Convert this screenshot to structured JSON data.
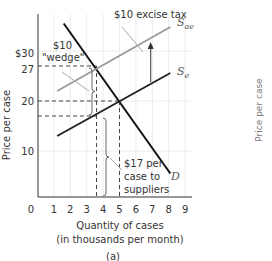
{
  "chart_data": {
    "type": "line",
    "panel_label": "(a)",
    "xlabel_line1": "Quantity of cases",
    "xlabel_line2": "(in thousands per month)",
    "ylabel": "Price per case",
    "right_panel_ylabel": "Price per case",
    "xlim": [
      0,
      9
    ],
    "ylim": [
      0,
      30
    ],
    "x_ticks": [
      "0",
      "1",
      "2",
      "3",
      "4",
      "5",
      "6",
      "7",
      "8",
      "9"
    ],
    "y_ticks": [
      {
        "value": 30,
        "label": "$30"
      },
      {
        "value": 27,
        "label": "27"
      },
      {
        "value": 20,
        "label": "20"
      },
      {
        "value": 10,
        "label": "10"
      }
    ],
    "grid": true,
    "series": [
      {
        "name": "D",
        "label": "D",
        "color": "#111111",
        "points": [
          [
            1.6,
            35.5
          ],
          [
            8.1,
            5.5
          ]
        ]
      },
      {
        "name": "Se",
        "label": "S",
        "subscript": "e",
        "color": "#222222",
        "points": [
          [
            1.2,
            13
          ],
          [
            8.1,
            25.6
          ]
        ]
      },
      {
        "name": "Sae",
        "label": "S",
        "subscript": "ae",
        "color": "#999999",
        "points": [
          [
            1.2,
            22
          ],
          [
            8.1,
            34.8
          ]
        ]
      }
    ],
    "equilibrium": {
      "q": 5,
      "p": 20
    },
    "tax_equilibrium": {
      "q": 3.6,
      "p_buyers": 27,
      "p_suppliers": 17
    },
    "annotations": {
      "excise_tax": "$10 excise tax",
      "wedge_line1": "$10",
      "wedge_line2": "\"wedge\"",
      "suppliers_line1": "$17 per",
      "suppliers_line2": "case to",
      "suppliers_line3": "suppliers"
    },
    "tax_arrow": {
      "q": 6.9,
      "from_p": 23.8,
      "to_p": 31.8
    }
  }
}
